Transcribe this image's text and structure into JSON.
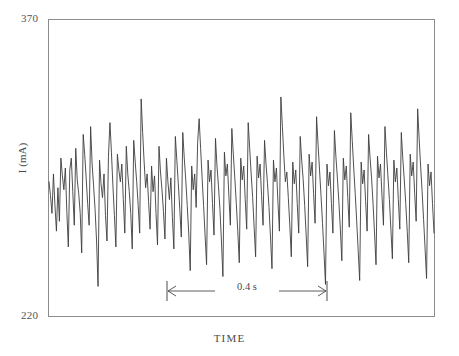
{
  "chart_data": {
    "type": "line",
    "title": "",
    "xlabel": "TIME",
    "ylabel": "I (mA)",
    "ylim": [
      220,
      370
    ],
    "ytick_labels": [
      "370",
      "220"
    ],
    "grid": false,
    "legend": null,
    "annotations": [
      {
        "name": "scale-bar",
        "label": "0.4 s",
        "orientation": "horizontal",
        "value": 0.4,
        "units": "s",
        "x_start_px": 167,
        "x_end_px": 327,
        "y_px": 291
      }
    ],
    "series": [
      {
        "name": "current-oscillation",
        "color": "#3d3d3d",
        "units": "mA",
        "x_units": "arbitrary time",
        "values": [
          288,
          281,
          272,
          292,
          276,
          263,
          285,
          268,
          300,
          291,
          284,
          295,
          273,
          255,
          294,
          300,
          283,
          266,
          305,
          289,
          282,
          272,
          252,
          312,
          302,
          290,
          277,
          266,
          316,
          297,
          286,
          274,
          258,
          235,
          299,
          287,
          280,
          292,
          271,
          258,
          301,
          318,
          303,
          286,
          271,
          255,
          302,
          294,
          288,
          297,
          279,
          262,
          306,
          292,
          283,
          272,
          254,
          309,
          298,
          288,
          276,
          262,
          330,
          313,
          298,
          285,
          292,
          278,
          264,
          296,
          283,
          291,
          272,
          256,
          306,
          293,
          284,
          273,
          259,
          300,
          288,
          279,
          290,
          270,
          254,
          311,
          299,
          287,
          274,
          260,
          313,
          300,
          289,
          276,
          262,
          243,
          296,
          284,
          292,
          275,
          308,
          320,
          305,
          290,
          276,
          261,
          246,
          299,
          288,
          294,
          277,
          261,
          310,
          296,
          286,
          274,
          258,
          240,
          303,
          291,
          297,
          281,
          266,
          315,
          302,
          290,
          277,
          263,
          247,
          300,
          289,
          296,
          279,
          264,
          318,
          305,
          292,
          280,
          265,
          250,
          301,
          290,
          297,
          281,
          266,
          309,
          297,
          287,
          275,
          260,
          244,
          299,
          288,
          295,
          278,
          263,
          331,
          316,
          301,
          288,
          293,
          280,
          266,
          250,
          298,
          287,
          294,
          277,
          262,
          311,
          299,
          289,
          276,
          261,
          245,
          302,
          291,
          298,
          282,
          267,
          321,
          307,
          294,
          281,
          267,
          252,
          236,
          297,
          286,
          293,
          277,
          262,
          314,
          301,
          290,
          278,
          264,
          248,
          300,
          289,
          296,
          280,
          265,
          323,
          309,
          295,
          282,
          268,
          253,
          238,
          298,
          287,
          294,
          278,
          263,
          312,
          300,
          290,
          277,
          262,
          246,
          301,
          290,
          297,
          281,
          266,
          316,
          303,
          291,
          279,
          264,
          249,
          299,
          288,
          295,
          279,
          264,
          313,
          300,
          289,
          277,
          263,
          247,
          302,
          291,
          298,
          282,
          268,
          325,
          310,
          296,
          283,
          269,
          254,
          239,
          297,
          286,
          293,
          277,
          262
        ]
      }
    ]
  },
  "figure": {
    "frame_color": "#8c8c8c",
    "background": "#ffffff"
  }
}
